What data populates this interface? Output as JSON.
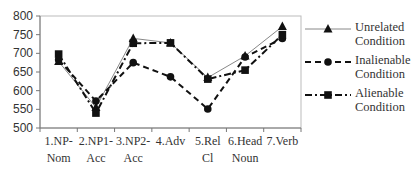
{
  "chart_data": {
    "type": "line",
    "title": "",
    "xlabel": "",
    "ylabel": "",
    "ylim": [
      500,
      800
    ],
    "yticks": [
      500,
      550,
      600,
      650,
      700,
      750,
      800
    ],
    "grid": false,
    "legend_position": "right",
    "categories": [
      [
        "1.NP-",
        "Nom"
      ],
      [
        "2.NP1-",
        "Acc"
      ],
      [
        "3.NP2-",
        "Acc"
      ],
      [
        "4.Adv",
        ""
      ],
      [
        "5.Rel",
        "Cl"
      ],
      [
        "6.Head",
        "Noun"
      ],
      [
        "7.Verb",
        ""
      ]
    ],
    "series": [
      {
        "name": "Unrelated Condition",
        "label_lines": [
          "Unrelated",
          "Condition"
        ],
        "marker": "triangle",
        "line_style": "solid",
        "color": "#555555",
        "values": [
          678,
          555,
          740,
          728,
          635,
          693,
          772
        ]
      },
      {
        "name": "Inalienable Condition",
        "label_lines": [
          "Inalienable",
          "Condition"
        ],
        "marker": "circle",
        "line_style": "dashed",
        "color": "#111111",
        "values": [
          683,
          572,
          675,
          637,
          551,
          690,
          740
        ]
      },
      {
        "name": "Alienable Condition",
        "label_lines": [
          "Alienable",
          "Condition"
        ],
        "marker": "square",
        "line_style": "dash-dot",
        "color": "#111111",
        "values": [
          698,
          540,
          727,
          728,
          631,
          655,
          750
        ]
      }
    ]
  }
}
